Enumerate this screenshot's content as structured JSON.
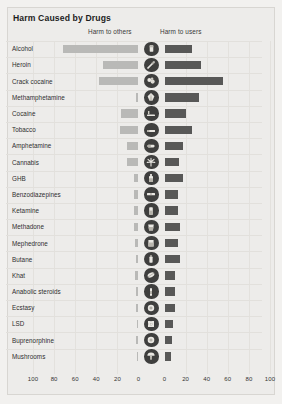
{
  "title": "Harm Caused by Drugs",
  "headers": {
    "left": "Harm to others",
    "right": "Harm to users"
  },
  "colors": {
    "background": "#f2f1ef",
    "panel": "#edecea",
    "bar_others": "#b9b9b7",
    "bar_users": "#585857",
    "icon": "#3f3f3e",
    "text": "#2e2e2e",
    "gridline": "#e3e1dd"
  },
  "axis": {
    "left_ticks": [
      "100",
      "80",
      "60",
      "40",
      "20",
      "0"
    ],
    "right_ticks": [
      "0",
      "20",
      "40",
      "60",
      "80",
      "100"
    ]
  },
  "chart_data": {
    "type": "bar",
    "title": "Harm Caused by Drugs",
    "orientation": "horizontal-diverging",
    "xlabel": "",
    "ylabel": "",
    "xlim_left": [
      0,
      100
    ],
    "xlim_right": [
      0,
      100
    ],
    "grid": true,
    "legend_position": "top",
    "categories": [
      "Alcohol",
      "Heroin",
      "Crack cocaine",
      "Methamphetamine",
      "Cocaine",
      "Tobacco",
      "Amphetamine",
      "Cannabis",
      "GHB",
      "Benzodiazepines",
      "Ketamine",
      "Methadone",
      "Mephedrone",
      "Butane",
      "Khat",
      "Anabolic steroids",
      "Ecstasy",
      "LSD",
      "Buprenorphine",
      "Mushrooms"
    ],
    "series": [
      {
        "name": "Harm to others",
        "color": "#b9b9b7",
        "values": [
          72,
          34,
          37,
          2,
          17,
          18,
          11,
          11,
          4,
          4,
          4,
          4,
          3,
          2,
          3,
          2,
          2,
          1,
          2,
          1
        ]
      },
      {
        "name": "Harm to users",
        "color": "#585857",
        "values": [
          26,
          35,
          55,
          33,
          20,
          26,
          18,
          14,
          18,
          13,
          13,
          15,
          13,
          15,
          10,
          10,
          10,
          8,
          7,
          6
        ]
      }
    ],
    "icons": [
      "beer-glass-icon",
      "syringe-icon",
      "crack-rock-icon",
      "meth-crystal-icon",
      "cocaine-powder-icon",
      "cigarette-icon",
      "amphetamine-pill-icon",
      "cannabis-leaf-icon",
      "ghb-bottle-icon",
      "benzodiazepine-pill-icon",
      "ketamine-vial-icon",
      "methadone-cup-icon",
      "mephedrone-bag-icon",
      "butane-canister-icon",
      "khat-leaf-icon",
      "steroid-ampoule-icon",
      "ecstasy-tablet-icon",
      "lsd-blotter-icon",
      "buprenorphine-tablet-icon",
      "mushroom-icon"
    ]
  }
}
